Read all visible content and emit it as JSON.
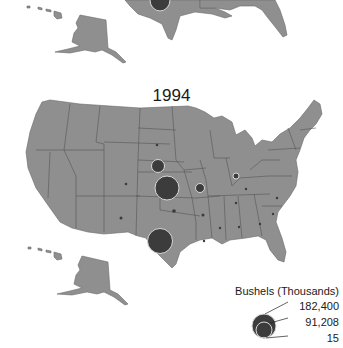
{
  "map": {
    "title": "1994",
    "legend": {
      "title": "Bushels (Thousands)",
      "values": [
        "182,400",
        "91,208",
        "15"
      ]
    },
    "symbols": [
      {
        "state": "Nebraska",
        "size": "medium-small"
      },
      {
        "state": "Kansas",
        "size": "large"
      },
      {
        "state": "Texas",
        "size": "large"
      },
      {
        "state": "Missouri",
        "size": "small"
      },
      {
        "state": "Indiana",
        "size": "tiny-ring"
      },
      {
        "state": "South Dakota",
        "size": "dot"
      },
      {
        "state": "Colorado",
        "size": "dot"
      },
      {
        "state": "New Mexico",
        "size": "dot"
      },
      {
        "state": "Oklahoma",
        "size": "dot"
      },
      {
        "state": "Arkansas",
        "size": "dot"
      },
      {
        "state": "Louisiana",
        "size": "dot"
      },
      {
        "state": "Mississippi",
        "size": "dot"
      },
      {
        "state": "Alabama",
        "size": "dot"
      },
      {
        "state": "Georgia",
        "size": "dot"
      },
      {
        "state": "South Carolina",
        "size": "dot"
      },
      {
        "state": "North Carolina",
        "size": "dot"
      },
      {
        "state": "Tennessee",
        "size": "dot"
      },
      {
        "state": "Kentucky",
        "size": "dot"
      }
    ],
    "colors": {
      "land": "#8f8f8f",
      "symbol": "#3c3c3c",
      "outline": "#d8d8d8"
    }
  }
}
